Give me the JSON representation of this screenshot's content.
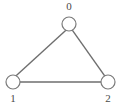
{
  "figure": {
    "title": "",
    "background_color": "#ffffff",
    "width": 121,
    "height": 107
  },
  "graph": {
    "type": "undirected-graph",
    "node_style": {
      "shape": "circle",
      "fill": "#ffffff",
      "stroke": "#7a7a7a",
      "stroke_width": 1.2,
      "radius": 7
    },
    "edge_style": {
      "stroke": "#6e6e6e",
      "stroke_width": 1.4
    },
    "label_color": "#4a4a4a",
    "nodes": [
      {
        "id": "0",
        "label": "0",
        "x": 69,
        "y": 24,
        "label_position": "above"
      },
      {
        "id": "1",
        "label": "1",
        "x": 13,
        "y": 82,
        "label_position": "below"
      },
      {
        "id": "2",
        "label": "2",
        "x": 108,
        "y": 82,
        "label_position": "below"
      }
    ],
    "edges": [
      {
        "source": "0",
        "target": "1"
      },
      {
        "source": "0",
        "target": "2"
      },
      {
        "source": "1",
        "target": "2"
      }
    ]
  }
}
